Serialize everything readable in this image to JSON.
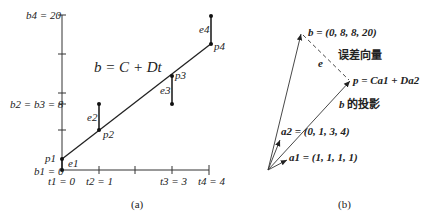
{
  "panel_a": {
    "equation": "b = C + Dt",
    "y_labels": [
      {
        "text": "b4 = 20",
        "value": 20
      },
      {
        "text": "b2 = b3 = 8",
        "value": 8
      },
      {
        "text": "b1 = 0",
        "value": 0
      }
    ],
    "x_labels": [
      {
        "text": "t1 = 0",
        "value": 0
      },
      {
        "text": "t2 = 1",
        "value": 1
      },
      {
        "text": "t3 = 3",
        "value": 3
      },
      {
        "text": "t4 = 4",
        "value": 4
      }
    ],
    "points": [
      {
        "name": "p1",
        "t": 0,
        "b": 0,
        "error": "e1"
      },
      {
        "name": "p2",
        "t": 1,
        "b": 8,
        "error": "e2"
      },
      {
        "name": "p3",
        "t": 3,
        "b": 8,
        "error": "e3"
      },
      {
        "name": "p4",
        "t": 4,
        "b": 20,
        "error": "e4"
      }
    ],
    "caption": "(a)"
  },
  "panel_b": {
    "b_vector": "b = (0, 8, 8, 20)",
    "error_label": "e",
    "error_vector_label": "误差向量",
    "p_vector": "p = Ca1 + Da2",
    "projection_label": "的投影",
    "a2_vector": "a2 = (0, 1, 3, 4)",
    "a1_vector": "a1 = (1, 1, 1, 1)",
    "caption": "(b)"
  }
}
